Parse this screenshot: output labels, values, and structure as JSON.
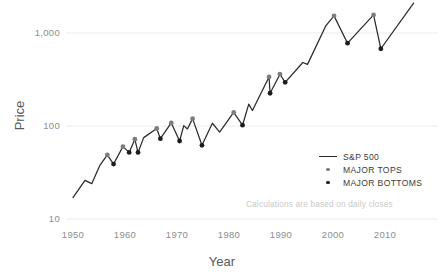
{
  "chart_data": {
    "type": "line",
    "title": "",
    "xlabel": "Year",
    "ylabel": "Price",
    "yscale": "log",
    "xlim": [
      1949,
      2016
    ],
    "ylim": [
      10,
      2600
    ],
    "grid": "horizontal-only",
    "y_ticks": [
      10,
      100,
      1000
    ],
    "y_tick_labels": [
      "10",
      "100",
      "1,000"
    ],
    "x_ticks": [
      1950,
      1960,
      1970,
      1980,
      1990,
      2000,
      2010
    ],
    "x_tick_labels": [
      "1950",
      "1960",
      "1970",
      "1980",
      "1990",
      "2000",
      "2010"
    ],
    "legend_position": "center-right",
    "annotation": "Calculations are based on daily closes",
    "series": [
      {
        "name": "S&P 500",
        "type": "line",
        "color": "#2b2b2b",
        "x": [
          1950.0,
          1952.3,
          1953.6,
          1955.2,
          1956.6,
          1957.8,
          1959.6,
          1960.8,
          1961.9,
          1962.5,
          1963.6,
          1966.1,
          1966.8,
          1968.9,
          1970.5,
          1971.3,
          1972.0,
          1973.0,
          1974.8,
          1976.8,
          1978.2,
          1980.9,
          1982.6,
          1983.8,
          1984.5,
          1987.7,
          1987.9,
          1989.8,
          1990.8,
          1994.2,
          1995.1,
          1998.6,
          2000.2,
          2002.8,
          2007.8,
          2009.2,
          2015.5
        ],
        "y": [
          17,
          26,
          24,
          38,
          49,
          39,
          60,
          52,
          72,
          52,
          75,
          94,
          73,
          108,
          69,
          101,
          93,
          120,
          62,
          107,
          86,
          140,
          102,
          172,
          147,
          337,
          225,
          360,
          295,
          482,
          460,
          1190,
          1527,
          777,
          1565,
          677,
          2100
        ]
      },
      {
        "name": "MAJOR TOPS",
        "type": "scatter",
        "color": "#7d7d7d",
        "points": [
          {
            "x": 1956.6,
            "y": 49,
            "label": "1956 top"
          },
          {
            "x": 1959.6,
            "y": 60,
            "label": "1959 top"
          },
          {
            "x": 1961.9,
            "y": 72,
            "label": "1961 top"
          },
          {
            "x": 1966.1,
            "y": 94,
            "label": "1966 top"
          },
          {
            "x": 1968.9,
            "y": 108,
            "label": "1968 top"
          },
          {
            "x": 1973.0,
            "y": 120,
            "label": "1973 top"
          },
          {
            "x": 1980.9,
            "y": 140,
            "label": "1980 top"
          },
          {
            "x": 1987.7,
            "y": 337,
            "label": "1987 top"
          },
          {
            "x": 1989.8,
            "y": 360,
            "label": "1990 top"
          },
          {
            "x": 2000.2,
            "y": 1527,
            "label": "2000 top"
          },
          {
            "x": 2007.8,
            "y": 1565,
            "label": "2007 top"
          }
        ]
      },
      {
        "name": "MAJOR BOTTOMS",
        "type": "scatter",
        "color": "#1c1c1c",
        "points": [
          {
            "x": 1957.8,
            "y": 39,
            "label": "1957 bottom"
          },
          {
            "x": 1960.8,
            "y": 52,
            "label": "1960 bottom"
          },
          {
            "x": 1962.5,
            "y": 52,
            "label": "1962 bottom"
          },
          {
            "x": 1966.8,
            "y": 73,
            "label": "1966 bottom"
          },
          {
            "x": 1970.5,
            "y": 69,
            "label": "1970 bottom"
          },
          {
            "x": 1974.8,
            "y": 62,
            "label": "1974 bottom"
          },
          {
            "x": 1982.6,
            "y": 102,
            "label": "1982 bottom"
          },
          {
            "x": 1987.9,
            "y": 225,
            "label": "1987 bottom"
          },
          {
            "x": 1990.8,
            "y": 295,
            "label": "1990 bottom"
          },
          {
            "x": 2002.8,
            "y": 777,
            "label": "2002 bottom"
          },
          {
            "x": 2009.2,
            "y": 677,
            "label": "2009 bottom"
          }
        ]
      }
    ]
  },
  "axes": {
    "y_title": "Price",
    "x_title": "Year"
  },
  "legend": {
    "items": [
      {
        "label": "S&P 500",
        "marker": "line"
      },
      {
        "label": "MAJOR TOPS",
        "marker": "dot-gray"
      },
      {
        "label": "MAJOR BOTTOMS",
        "marker": "dot-black"
      }
    ]
  },
  "footnote": {
    "text": "Calculations are based on daily closes"
  },
  "colors": {
    "line": "#2b2b2b",
    "tops": "#7d7d7d",
    "bottoms": "#1c1c1c",
    "grid": "#ececec",
    "tick_text": "#8d8d8d",
    "footnote_text": "#c9c9c9"
  }
}
